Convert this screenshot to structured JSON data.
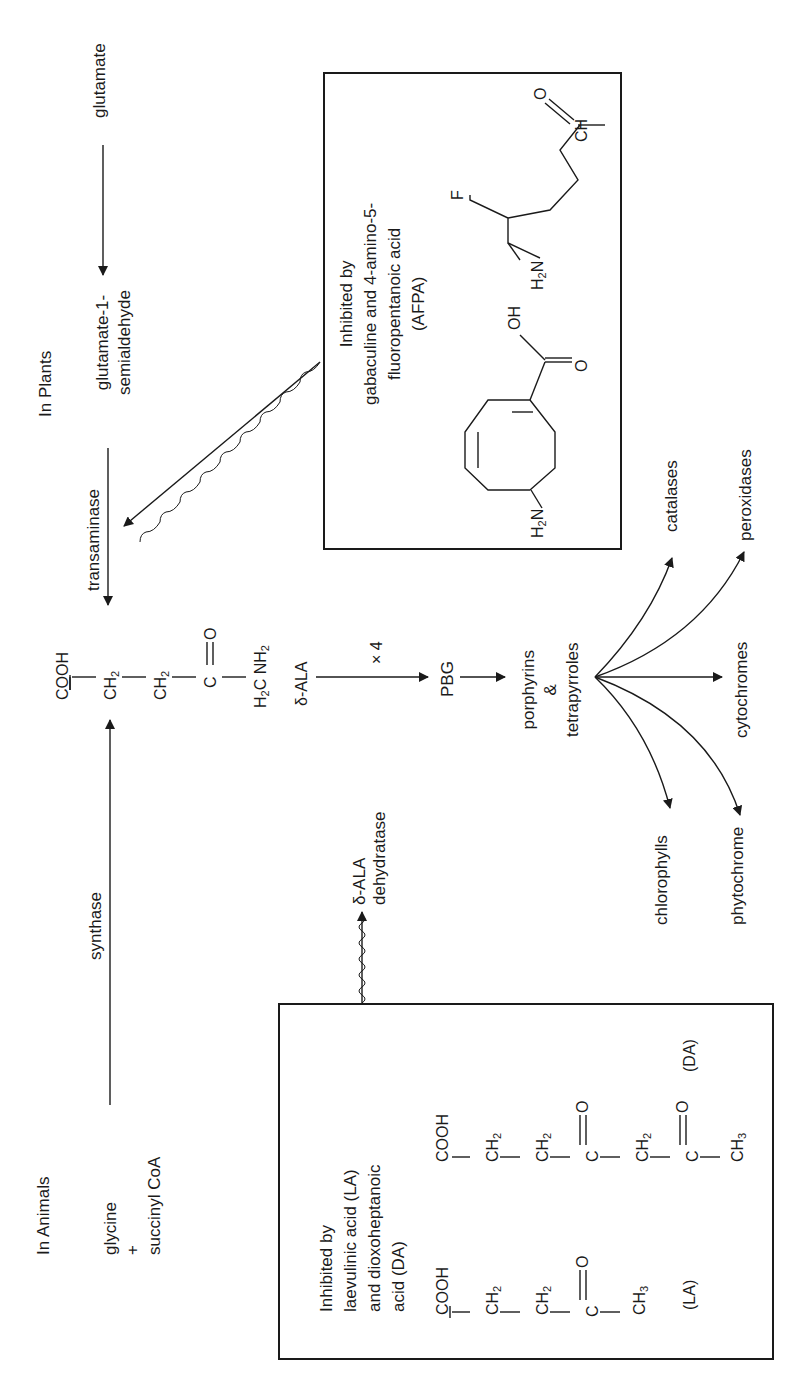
{
  "orientation": "rotated 90 degrees counter-clockwise",
  "plants": {
    "heading": "In Plants",
    "start": "glutamate",
    "intermediate_line1": "glutamate-1-",
    "intermediate_line2": "semialdehyde",
    "enzyme": "transaminase"
  },
  "animals": {
    "heading": "In Animals",
    "substrate1": "glycine",
    "plus": "+",
    "substrate2": "succinyl CoA",
    "enzyme": "synthase"
  },
  "ala_structure": {
    "groups": [
      "COOH",
      "CH2",
      "CH2",
      "C",
      "H2C"
    ],
    "oxo": "O",
    "amine": "NH2",
    "name": "δ-ALA"
  },
  "pathway": {
    "multiplier": "× 4",
    "pbg": "PBG",
    "product_line1": "porphyrins",
    "product_line2": "&",
    "product_line3": "tetrapyrroles",
    "branches": [
      "catalases",
      "peroxidases",
      "cytochromes",
      "phytochrome",
      "chlorophylls"
    ]
  },
  "dehydratase": {
    "line1": "δ-ALA",
    "line2": "dehydratase"
  },
  "inhibitor_box_plants": {
    "line1": "Inhibited by",
    "line2": "gabaculine and 4-amino-5-",
    "line3": "fluoropentanoic acid",
    "line4": "(AFPA)",
    "gabaculine_labels": {
      "amine": "H2N",
      "hydroxyl": "OH",
      "oxo": "O"
    },
    "afpa_labels": {
      "fluorine": "F",
      "amine": "H2N",
      "oxo": "O",
      "aldehyde": "CH"
    }
  },
  "inhibitor_box_animals": {
    "line1": "Inhibited by",
    "line2": "laevulinic acid (LA)",
    "line3": "and dioxoheptanoic",
    "line4": "acid (DA)",
    "la": {
      "groups": [
        "COOH",
        "CH2",
        "CH2",
        "C",
        "CH3"
      ],
      "oxo": "O",
      "label": "(LA)"
    },
    "da": {
      "groups": [
        "COOH",
        "CH2",
        "CH2",
        "C",
        "CH2",
        "C",
        "CH3"
      ],
      "oxo": "O",
      "label": "(DA)"
    }
  },
  "colors": {
    "ink": "#1a1a1a",
    "background": "#ffffff"
  }
}
